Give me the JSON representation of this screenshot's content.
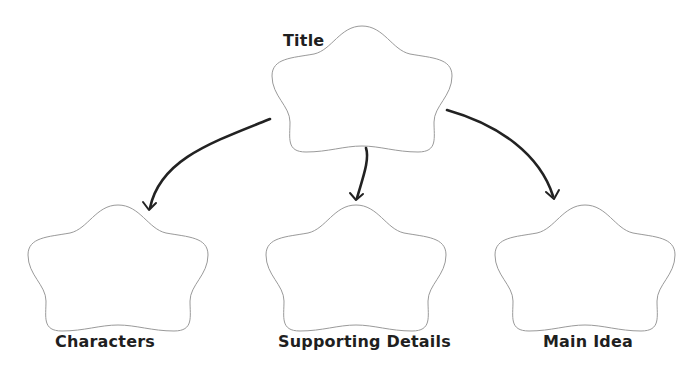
{
  "diagram": {
    "type": "graphic-organizer",
    "colors": {
      "background": "#ffffff",
      "outline": "#9a9a9a",
      "arrow": "#222222",
      "text": "#1f1f1f"
    },
    "nodes": [
      {
        "id": "title",
        "label": "Title",
        "content": ""
      },
      {
        "id": "characters",
        "label": "Characters",
        "content": ""
      },
      {
        "id": "supporting-details",
        "label": "Supporting Details",
        "content": ""
      },
      {
        "id": "main-idea",
        "label": "Main Idea",
        "content": ""
      }
    ],
    "edges": [
      {
        "from": "title",
        "to": "characters"
      },
      {
        "from": "title",
        "to": "supporting-details"
      },
      {
        "from": "title",
        "to": "main-idea"
      }
    ]
  }
}
